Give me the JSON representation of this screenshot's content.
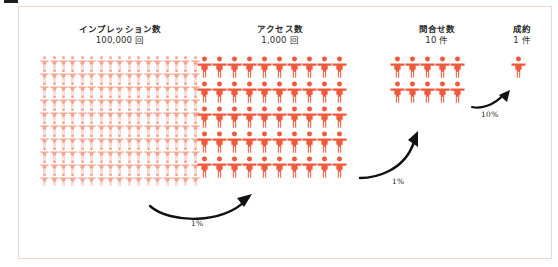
{
  "figure": {
    "background_color": "#ffffff",
    "frame_border_color": "#f0d6cc",
    "person_color_dark": "#f05a3c",
    "person_color_light": "#f4a48f",
    "arrow_color": "#111111"
  },
  "columns": [
    {
      "id": "impressions",
      "title": "インプレッション数",
      "value": "100,000 回",
      "icon_count_label": "100,000",
      "grid_cols": 17,
      "grid_rows": 10,
      "icon_style": "small-light"
    },
    {
      "id": "access",
      "title": "アクセス数",
      "value": "1,000 回",
      "icon_count_label": "1,000",
      "grid_cols": 10,
      "grid_rows": 5,
      "icon_style": "medium-dark"
    },
    {
      "id": "inquiries",
      "title": "問合せ数",
      "value": "10 件",
      "icon_count_label": "10",
      "grid_cols": 5,
      "grid_rows": 2,
      "icon_style": "medium-dark"
    },
    {
      "id": "contracts",
      "title": "成約",
      "value": "1 件",
      "icon_count_label": "1",
      "grid_cols": 1,
      "grid_rows": 1,
      "icon_style": "medium-dark"
    }
  ],
  "conversions": [
    {
      "id": "impressions-to-access",
      "label": "1%"
    },
    {
      "id": "access-to-inquiries",
      "label": "1%"
    },
    {
      "id": "inquiries-to-contracts",
      "label": "10%"
    }
  ],
  "chart_data": {
    "type": "pictogram",
    "title": "",
    "categories": [
      "インプレッション数",
      "アクセス数",
      "問合せ数",
      "成約"
    ],
    "values": [
      100000,
      1000,
      10,
      1
    ],
    "value_labels": [
      "100,000 回",
      "1,000 回",
      "10 件",
      "1 件"
    ],
    "conversion_rates": [
      "1%",
      "1%",
      "10%"
    ],
    "xlabel": "",
    "ylabel": "",
    "legend": [],
    "grid": false
  }
}
